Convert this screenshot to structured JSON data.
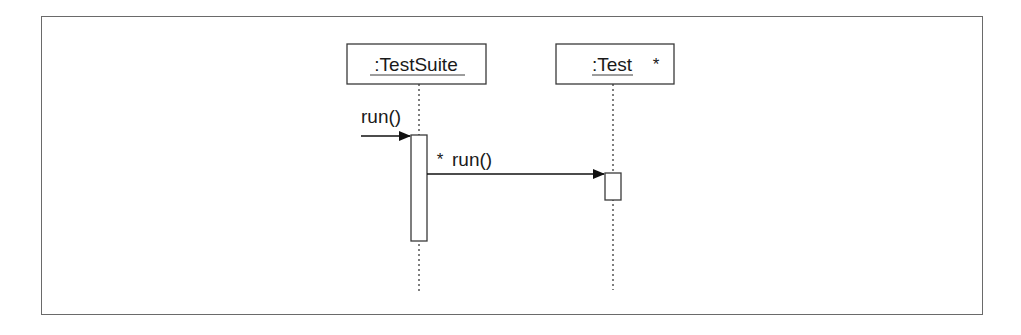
{
  "diagram": {
    "type": "UML sequence diagram",
    "colors": {
      "line": "#3a3a3a",
      "frame": "#6a6a6a",
      "text": "#1a1a1a",
      "background": "#ffffff"
    },
    "lifelines": [
      {
        "id": "testsuite",
        "label": ":TestSuite",
        "multiplicity": ""
      },
      {
        "id": "test",
        "label": ":Test",
        "multiplicity": "*"
      }
    ],
    "messages": [
      {
        "id": "incoming-run",
        "label": "run()",
        "from": "external",
        "to": "testsuite",
        "iteration": ""
      },
      {
        "id": "iterated-run",
        "label": "run()",
        "from": "testsuite",
        "to": "test",
        "iteration": "*"
      }
    ]
  }
}
